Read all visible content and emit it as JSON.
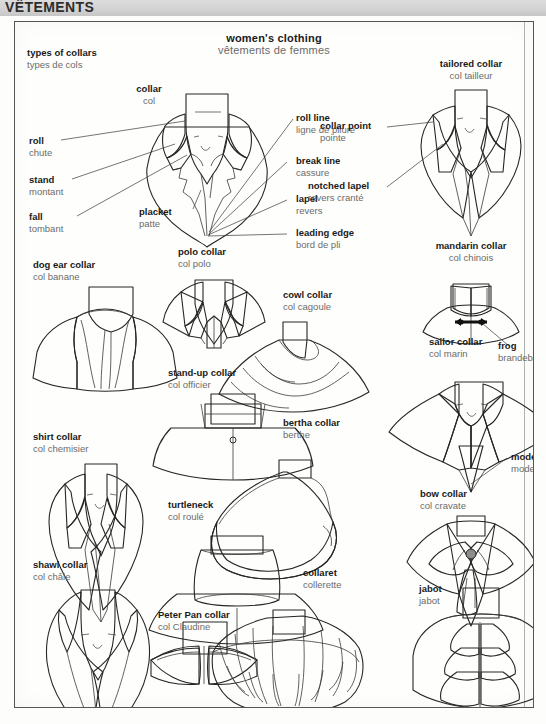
{
  "page": {
    "section_header": "VÊTEMENTS",
    "plate_title_en": "women's clothing",
    "plate_title_fr": "vêtements de femmes",
    "group_title_en": "types of collars",
    "group_title_fr": "types de cols",
    "colors": {
      "band": "#d6d6d6",
      "ink": "#1a1a1a",
      "french_ink": "#6b6b6b",
      "fabric_light": "#ededea",
      "fabric_mid": "#b9b9b5",
      "fabric_dark": "#8f8f8b",
      "leader_line": "#3a3a3a",
      "frame": "#555555"
    }
  },
  "callouts": [
    {
      "id": "collar",
      "en": "collar",
      "fr": "col"
    },
    {
      "id": "roll",
      "en": "roll",
      "fr": "chute"
    },
    {
      "id": "stand",
      "en": "stand",
      "fr": "montant"
    },
    {
      "id": "fall",
      "en": "fall",
      "fr": "tombant"
    },
    {
      "id": "placket",
      "en": "placket",
      "fr": "patte"
    },
    {
      "id": "roll-line",
      "en": "roll line",
      "fr": "ligne de pliure"
    },
    {
      "id": "break-line",
      "en": "break line",
      "fr": "cassure"
    },
    {
      "id": "lapel",
      "en": "lapel",
      "fr": "revers"
    },
    {
      "id": "leading-edge",
      "en": "leading edge",
      "fr": "bord de pli"
    },
    {
      "id": "collar-point",
      "en": "collar point",
      "fr": "pointe"
    },
    {
      "id": "notched-lapel",
      "en": "notched lapel",
      "fr": "revers cranté"
    },
    {
      "id": "frog",
      "en": "frog",
      "fr": "brandebourg"
    },
    {
      "id": "modesty",
      "en": "modesty",
      "fr": "modestie"
    }
  ],
  "collar_types": [
    {
      "id": "tailored",
      "en": "tailored collar",
      "fr": "col tailleur"
    },
    {
      "id": "mandarin",
      "en": "mandarin collar",
      "fr": "col chinois"
    },
    {
      "id": "dog-ear",
      "en": "dog ear collar",
      "fr": "col banane"
    },
    {
      "id": "polo",
      "en": "polo collar",
      "fr": "col polo"
    },
    {
      "id": "cowl",
      "en": "cowl collar",
      "fr": "col cagoule"
    },
    {
      "id": "sailor",
      "en": "sailor collar",
      "fr": "col marin"
    },
    {
      "id": "stand-up",
      "en": "stand-up collar",
      "fr": "col officier"
    },
    {
      "id": "shirt",
      "en": "shirt collar",
      "fr": "col chemisier"
    },
    {
      "id": "bertha",
      "en": "bertha collar",
      "fr": "berthe"
    },
    {
      "id": "bow",
      "en": "bow collar",
      "fr": "col cravate"
    },
    {
      "id": "turtleneck",
      "en": "turtleneck",
      "fr": "col roulé"
    },
    {
      "id": "shawl",
      "en": "shawl collar",
      "fr": "col châle"
    },
    {
      "id": "collaret",
      "en": "collaret",
      "fr": "collerette"
    },
    {
      "id": "peter-pan",
      "en": "Peter Pan collar",
      "fr": "col Claudine"
    },
    {
      "id": "jabot",
      "en": "jabot",
      "fr": "jabot"
    }
  ]
}
